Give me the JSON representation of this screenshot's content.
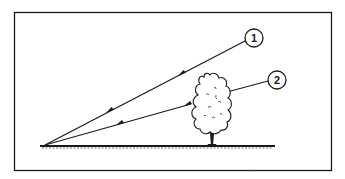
{
  "diagram": {
    "type": "line-of-sight illustration",
    "colors": {
      "ink": "#1a1a1a",
      "background": "#ffffff"
    },
    "labels": [
      {
        "id": "1",
        "text": "1",
        "description": "Unobstructed line of sight to target"
      },
      {
        "id": "2",
        "text": "2",
        "description": "Line of sight obstructed by tree"
      }
    ],
    "elements": {
      "frame": "border",
      "ground": "ground-line",
      "observer_point": "origin",
      "tree": "tree",
      "arrows": "direction arrows pointing toward observer"
    }
  }
}
